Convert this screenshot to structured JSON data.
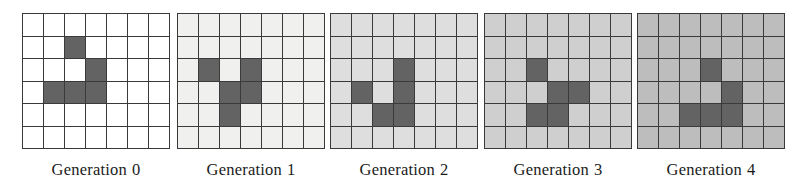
{
  "figure": {
    "name": "cellular-automaton-generations",
    "grid_columns": 7,
    "grid_rows": 6,
    "grid_line_color": "#3a3a3a",
    "alive_cell_color": "#636363"
  },
  "panels": [
    {
      "caption_label": "Generation",
      "caption_index": "0",
      "background_color": "#ffffff",
      "alive_cells": [
        [
          1,
          2
        ],
        [
          2,
          3
        ],
        [
          3,
          1
        ],
        [
          3,
          2
        ],
        [
          3,
          3
        ]
      ]
    },
    {
      "caption_label": "Generation",
      "caption_index": "1",
      "background_color": "#f0f0ee",
      "alive_cells": [
        [
          2,
          1
        ],
        [
          2,
          3
        ],
        [
          3,
          2
        ],
        [
          3,
          3
        ],
        [
          4,
          2
        ]
      ]
    },
    {
      "caption_label": "Generation",
      "caption_index": "2",
      "background_color": "#dedede",
      "alive_cells": [
        [
          2,
          3
        ],
        [
          3,
          1
        ],
        [
          3,
          3
        ],
        [
          4,
          2
        ],
        [
          4,
          3
        ]
      ]
    },
    {
      "caption_label": "Generation",
      "caption_index": "3",
      "background_color": "#cfcfcf",
      "alive_cells": [
        [
          2,
          2
        ],
        [
          3,
          3
        ],
        [
          3,
          4
        ],
        [
          4,
          2
        ],
        [
          4,
          3
        ]
      ]
    },
    {
      "caption_label": "Generation",
      "caption_index": "4",
      "background_color": "#bdbdbd",
      "alive_cells": [
        [
          2,
          3
        ],
        [
          3,
          4
        ],
        [
          4,
          2
        ],
        [
          4,
          3
        ],
        [
          4,
          4
        ]
      ]
    }
  ],
  "panel_offsets_px": [
    22,
    177,
    330,
    484,
    637
  ]
}
